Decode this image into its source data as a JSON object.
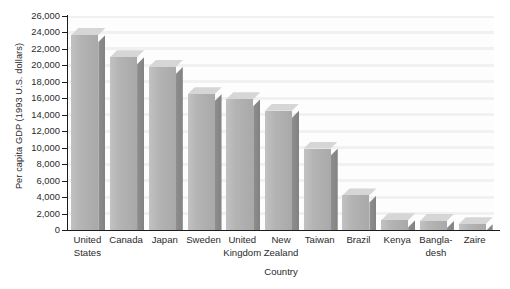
{
  "chart_data": {
    "type": "bar",
    "title": "",
    "xlabel": "Country",
    "ylabel": "Per capita GDP (1993 U.S. dollars)",
    "categories": [
      "United States",
      "Canada",
      "Japan",
      "Sweden",
      "United Kingdom",
      "New Zealand",
      "Taiwan",
      "Brazil",
      "Kenya",
      "Bangladesh",
      "Zaire"
    ],
    "category_lines": [
      [
        "United",
        "States"
      ],
      [
        "Canada",
        ""
      ],
      [
        "Japan",
        ""
      ],
      [
        "Sweden",
        ""
      ],
      [
        "United",
        "Kingdom"
      ],
      [
        "New",
        "Zealand"
      ],
      [
        "Taiwan",
        ""
      ],
      [
        "Brazil",
        ""
      ],
      [
        "Kenya",
        ""
      ],
      [
        "Bangla-",
        "desh"
      ],
      [
        "Zaire",
        ""
      ]
    ],
    "values": [
      23700,
      21000,
      19800,
      16500,
      15900,
      14500,
      9900,
      4200,
      1200,
      1100,
      700
    ],
    "ylim": [
      0,
      26000
    ],
    "ytick_values": [
      0,
      2000,
      4000,
      6000,
      8000,
      10000,
      12000,
      14000,
      16000,
      18000,
      20000,
      22000,
      24000,
      26000
    ],
    "ytick_labels": [
      "0",
      "2,000",
      "4,000",
      "6,000",
      "8,000",
      "10,000",
      "12,000",
      "14,000",
      "16,000",
      "18,000",
      "20,000",
      "22,000",
      "24,000",
      "26,000"
    ],
    "grid": true,
    "legend": null,
    "style": {
      "bar_front_color": "#b4b4b4",
      "bar_side_color": "#868686",
      "bar_top_color": "#d6d6d6",
      "axis_color": "#1c1c1c",
      "grid_color": "#f1f1f1",
      "background": "#ffffff",
      "depth_3d": true
    }
  }
}
